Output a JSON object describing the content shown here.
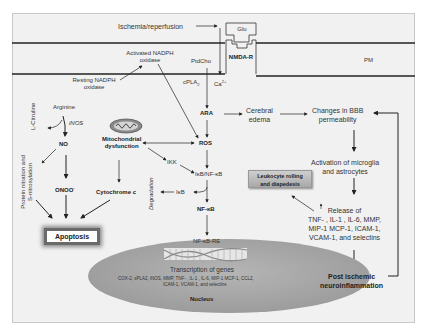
{
  "diagram": {
    "membrane": {
      "trigger": "Ischemia/reperfusion",
      "ligand": "Glu",
      "receptor": "NMDA-R",
      "membrane_label": "PM",
      "activated_nadph": "Activated NADPH oxidase",
      "resting_nadph": "Resting NADPH oxidase",
      "ptdcho": "PtdCho",
      "cpla2": "cPLA",
      "cpla2_sub": "2",
      "calcium": "Ca",
      "calcium_sup": "2+"
    },
    "left_pathway": {
      "arginine": "Arginine",
      "inos": "iNOS",
      "l_citruline": "L-Citruline",
      "no": "NO",
      "protein_nitration": "Protein nitration and S-nitrosylation",
      "onoo": "ONOO",
      "onoo_sup": "-",
      "mito_line1": "Mitochondrial",
      "mito_line2": "dysfunction",
      "cytochrome": "Cytochrome c",
      "apoptosis": "Apoptosis"
    },
    "center_pathway": {
      "ara": "ARA",
      "ros": "ROS",
      "ikk": "IKK",
      "ikb_nfkb": "IκB/NF-κB",
      "ikb": "IκB",
      "degradation": "Degradation",
      "nfkb": "NF-κB",
      "nfkb_re": "NF-κB-RE"
    },
    "nucleus": {
      "transcription": "Transcription of genes",
      "genes_line1": "COX-2, sPLA2, iNOS, MMP, TNF- , IL-1 , IL-6, MIP-1 MCP-1, CCL2,",
      "genes_line2": "ICAM-1, VCAM-1, and selectins",
      "label": "Nucleus"
    },
    "right_pathway": {
      "edema_line1": "Cerebral",
      "edema_line2": "edema",
      "bbb_line1": "Changes in BBB",
      "bbb_line2": "permeability",
      "activation_line1": "Activation of microglia",
      "activation_line2": "and astrocytes",
      "leukocyte_line1": "Leukocyte rolling",
      "leukocyte_line2": "and diapedesis",
      "release_line1": "Release of",
      "release_line2": "TNF- , IL-1 , IL-6, MMP,",
      "release_line3": "MIP-1 MCP-1, ICAM-1,",
      "release_line4": "VCAM-1, and selectins",
      "post_line1": "Post ischemic",
      "post_line2": "neuroinflammation"
    },
    "colors": {
      "background": "#f1f1f1",
      "membrane_line": "#222222",
      "nucleus_fill": "#a9a9a9",
      "apoptosis_glow": "#6a6a6a",
      "leukocyte_fill": "#b8b8b8"
    }
  }
}
